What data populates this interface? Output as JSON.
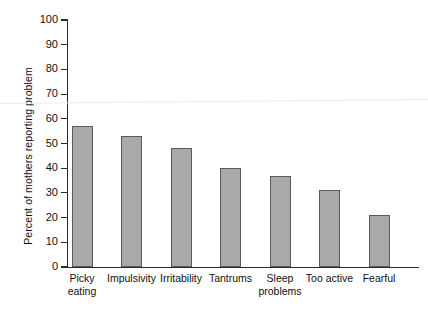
{
  "chart_data": {
    "type": "bar",
    "title": "",
    "subtitle": "",
    "xlabel": "",
    "ylabel": "Percent of mothers reporting problem",
    "ylim": [
      0,
      100
    ],
    "ytick_step": 10,
    "yticks": [
      100,
      90,
      80,
      70,
      60,
      50,
      40,
      30,
      20,
      10,
      0
    ],
    "grid": false,
    "legend": null,
    "legend_position": "none",
    "bar_fill_color": "#a9a9a9",
    "bar_edge_color": "#5a5a5a",
    "axis_color": "#2b2b2b",
    "categories": [
      "Picky eating",
      "Impulsivity",
      "Irritability",
      "Tantrums",
      "Sleep problems",
      "Too active",
      "Fearful"
    ],
    "category_lines": [
      [
        "Picky",
        "eating"
      ],
      [
        "Impulsivity"
      ],
      [
        "Irritability"
      ],
      [
        "Tantrums"
      ],
      [
        "Sleep",
        "problems"
      ],
      [
        "Too active"
      ],
      [
        "Fearful"
      ]
    ],
    "values": [
      57,
      53,
      48,
      40,
      37,
      31,
      21
    ]
  }
}
